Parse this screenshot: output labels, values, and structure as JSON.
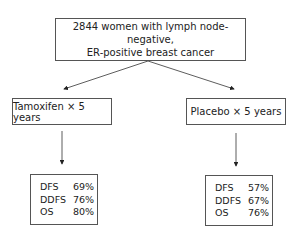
{
  "population": {
    "line1": "2844 women with lymph node-negative,",
    "line2": "ER-positive breast cancer"
  },
  "arms": [
    {
      "label": "Tamoxifen × 5 years",
      "results": [
        {
          "metric": "DFS",
          "value": "69%"
        },
        {
          "metric": "DDFS",
          "value": "76%"
        },
        {
          "metric": "OS",
          "value": "80%"
        }
      ]
    },
    {
      "label": "Placebo × 5 years",
      "results": [
        {
          "metric": "DFS",
          "value": "57%"
        },
        {
          "metric": "DDFS",
          "value": "67%"
        },
        {
          "metric": "OS",
          "value": "76%"
        }
      ]
    }
  ],
  "colors": {
    "line": "#333333",
    "border": "#555555",
    "text": "#222222"
  }
}
